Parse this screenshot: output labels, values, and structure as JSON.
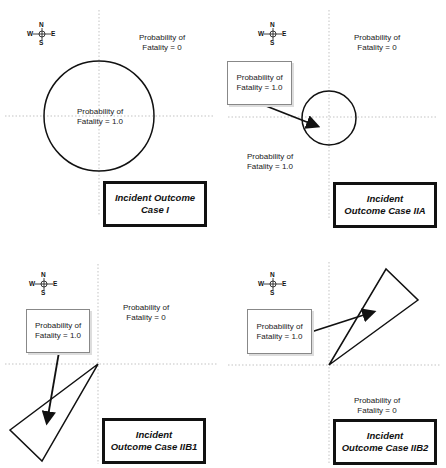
{
  "compass": {
    "n": "N",
    "s": "S",
    "e": "E",
    "w": "W"
  },
  "panels": [
    {
      "case_label_line1": "Incident Outcome",
      "case_label_line2": "Case I",
      "region_outside_line1": "Probability of",
      "region_outside_line2": "Fatality = 0",
      "region_inside_line1": "Probability of",
      "region_inside_line2": "Fatality = 1.0",
      "shape": "circle"
    },
    {
      "case_label_line1": "Incident",
      "case_label_line2": "Outcome Case IIA",
      "region_outside_line1": "Probability of",
      "region_outside_line2": "Fatality = 0",
      "callout_line1": "Probability of",
      "callout_line2": "Fatality = 1.0",
      "region_lower_line1": "Probability of",
      "region_lower_line2": "Fatality = 1.0",
      "shape": "circle"
    },
    {
      "case_label_line1": "Incident",
      "case_label_line2": "Outcome Case IIB1",
      "region_outside_line1": "Probability of",
      "region_outside_line2": "Fatality = 0",
      "callout_line1": "Probability of",
      "callout_line2": "Fatality = 1.0",
      "shape": "triangle"
    },
    {
      "case_label_line1": "Incident",
      "case_label_line2": "Outcome Case IIB2",
      "region_outside_line1": "Probability of",
      "region_outside_line2": "Fatality = 0",
      "callout_line1": "Probability of",
      "callout_line2": "Fatality = 1.0",
      "shape": "triangle"
    }
  ]
}
